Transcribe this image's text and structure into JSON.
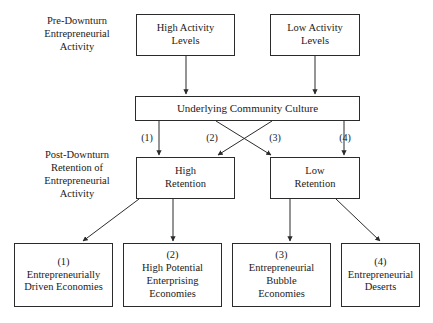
{
  "figure": {
    "background_color": "#ffffff",
    "line_color": "#2b2b2b",
    "text_color": "#1a1a1a"
  },
  "side_labels": {
    "pre_downturn": "Pre-Downturn\nEntrepreneurial\nActivity",
    "post_downturn": "Post-Downturn\nRetention of\nEntrepreneurial\nActivity"
  },
  "nodes": {
    "high_activity": "High Activity\nLevels",
    "low_activity": "Low Activity\nLevels",
    "culture": "Underlying Community Culture",
    "high_retention": "High\nRetention",
    "low_retention": "Low\nRetention",
    "outcome_1": "(1)\nEntrepreneurially\nDriven Economies",
    "outcome_2": "(2)\nHigh Potential\nEnterprising\nEconomies",
    "outcome_3": "(3)\nEntrepreneurial\nBubble\nEconomies",
    "outcome_4": "(4)\nEntrepreneurial\nDeserts"
  },
  "path_labels": {
    "p1": "(1)",
    "p2": "(2)",
    "p3": "(3)",
    "p4": "(4)"
  },
  "edges": [
    {
      "name": "high-activity-to-culture",
      "from": "high_activity",
      "to": "culture",
      "style": "straight-down",
      "label": ""
    },
    {
      "name": "low-activity-to-culture",
      "from": "low_activity",
      "to": "culture",
      "style": "straight-down",
      "label": ""
    },
    {
      "name": "culture-to-high-retention-1",
      "from": "culture",
      "to": "high_retention",
      "style": "straight-down",
      "label": "(1)"
    },
    {
      "name": "culture-to-low-retention-2",
      "from": "culture",
      "to": "low_retention",
      "style": "crossing",
      "label": "(2)"
    },
    {
      "name": "culture-to-high-retention-3",
      "from": "culture",
      "to": "high_retention",
      "style": "crossing",
      "label": "(3)"
    },
    {
      "name": "culture-to-low-retention-4",
      "from": "culture",
      "to": "low_retention",
      "style": "straight-down",
      "label": "(4)"
    },
    {
      "name": "high-retention-to-outcome-1",
      "from": "high_retention",
      "to": "outcome_1",
      "style": "diagonal-left",
      "label": ""
    },
    {
      "name": "high-retention-to-outcome-2",
      "from": "high_retention",
      "to": "outcome_2",
      "style": "straight-down",
      "label": ""
    },
    {
      "name": "low-retention-to-outcome-3",
      "from": "low_retention",
      "to": "outcome_3",
      "style": "straight-down",
      "label": ""
    },
    {
      "name": "low-retention-to-outcome-4",
      "from": "low_retention",
      "to": "outcome_4",
      "style": "diagonal-right",
      "label": ""
    }
  ]
}
